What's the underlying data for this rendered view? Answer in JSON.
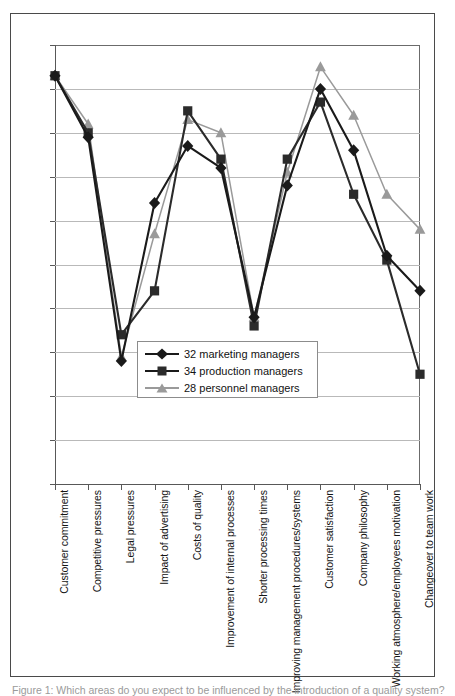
{
  "figure": {
    "caption": "Figure 1: Which areas do you expect to be influenced by the introduction of a quality system?"
  },
  "legend": {
    "position": "inside-lower-left",
    "entries": [
      {
        "label": "32 marketing managers",
        "marker": "diamond",
        "color": "#1a1a1a"
      },
      {
        "label": "34 production managers",
        "marker": "square",
        "color": "#2b2b2b"
      },
      {
        "label": "28 personnel managers",
        "marker": "triangle",
        "color": "#9a9a9a"
      }
    ]
  },
  "axes": {
    "y_tick_count": 10,
    "y_labels_visible": false,
    "gridlines": true,
    "x_tick_count": 12
  },
  "chart_data": {
    "type": "line",
    "title": "",
    "xlabel": "",
    "ylabel": "",
    "ylim": [
      0,
      100
    ],
    "grid": true,
    "legend_position": "inside-lower-left",
    "y_axis_labeled": false,
    "categories": [
      "Customer commitment",
      "Competitive pressures",
      "Legal pressures",
      "Impact of advertising",
      "Costs of quality",
      "Improvement of internal processes",
      "Shorter processing times",
      "Improving management procedures/systems",
      "Customer satisfaction",
      "Company philosophy",
      "Working atmosphere/employees motivation",
      "Changeover to team work"
    ],
    "series": [
      {
        "name": "32 marketing managers",
        "marker": "diamond",
        "color": "#1a1a1a",
        "values": [
          93,
          79,
          28,
          64,
          77,
          72,
          38,
          68,
          90,
          76,
          52,
          44
        ]
      },
      {
        "name": "34 production managers",
        "marker": "square",
        "color": "#2b2b2b",
        "values": [
          93,
          80,
          34,
          44,
          85,
          74,
          36,
          74,
          87,
          66,
          51,
          25
        ]
      },
      {
        "name": "28 personnel managers",
        "marker": "triangle",
        "color": "#9a9a9a",
        "values": [
          93,
          82,
          29,
          57,
          83,
          80,
          38,
          71,
          95,
          84,
          66,
          58
        ]
      }
    ]
  }
}
